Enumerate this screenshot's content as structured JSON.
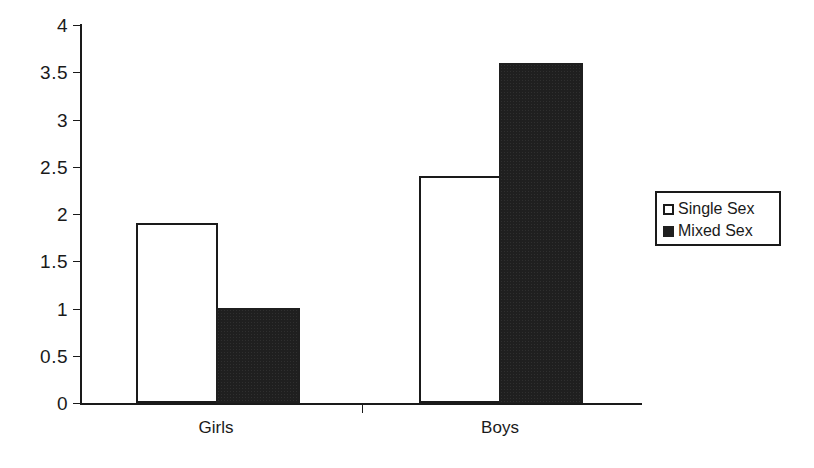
{
  "chart_data": {
    "type": "bar",
    "title": "",
    "subtitle": "",
    "xlabel": "",
    "ylabel": "",
    "categories": [
      "Girls",
      "Boys"
    ],
    "series": [
      {
        "name": "Single Sex",
        "values": [
          1.9,
          2.4
        ],
        "color": "#ffffff",
        "edge_color": "#1a1a1a"
      },
      {
        "name": "Mixed Sex",
        "values": [
          1.0,
          3.6
        ],
        "color": "#1f1f1f",
        "edge_color": "#1f1f1f"
      }
    ],
    "ylim": [
      0,
      4
    ],
    "ytick_labels": [
      "4",
      "3.5",
      "3",
      "2.5",
      "2",
      "1.5",
      "1",
      "0.5",
      "0"
    ],
    "ytick_values": [
      4,
      3.5,
      3,
      2.5,
      2,
      1.5,
      1,
      0.5,
      0
    ],
    "grid": false,
    "legend_position": "right",
    "bar_group_gap": true,
    "annotations": []
  },
  "axes": {
    "y_ticks": [
      {
        "label": "4",
        "value": 4
      },
      {
        "label": "3.5",
        "value": 3.5
      },
      {
        "label": "3",
        "value": 3
      },
      {
        "label": "2.5",
        "value": 2.5
      },
      {
        "label": "2",
        "value": 2
      },
      {
        "label": "1.5",
        "value": 1.5
      },
      {
        "label": "1",
        "value": 1
      },
      {
        "label": "0.5",
        "value": 0.5
      },
      {
        "label": "0",
        "value": 0
      }
    ],
    "x_categories": [
      {
        "label": "Girls"
      },
      {
        "label": "Boys"
      }
    ]
  },
  "legend": {
    "entries": [
      {
        "label": "Single Sex",
        "swatch": "open-square-swatch"
      },
      {
        "label": "Mixed Sex",
        "swatch": "filled-square-swatch"
      }
    ]
  },
  "colors": {
    "axis": "#1a1a1a",
    "bar_single_fill": "#ffffff",
    "bar_mixed_fill": "#1f1f1f",
    "background": "#ffffff"
  }
}
